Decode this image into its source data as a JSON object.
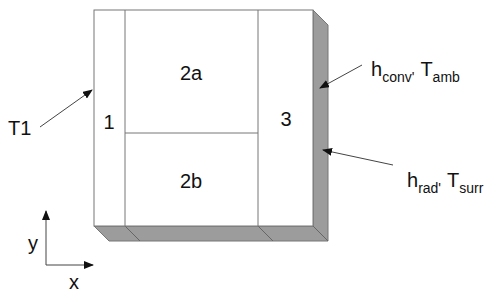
{
  "diagram": {
    "type": "layered-block-heat-transfer",
    "colors": {
      "face": "#ffffff",
      "edge": "#777777",
      "shade": "#9c9c9c",
      "arrow": "#333333",
      "text": "#111111"
    },
    "regions": [
      {
        "id": "1",
        "label": "1"
      },
      {
        "id": "2a",
        "label": "2a"
      },
      {
        "id": "2b",
        "label": "2b"
      },
      {
        "id": "3",
        "label": "3"
      }
    ],
    "boundary_conditions": {
      "left": {
        "label": "T1"
      },
      "right_top": {
        "h_main": "h",
        "h_sub": "conv",
        "sep": "'",
        "t_main": "T",
        "t_sub": "amb"
      },
      "right_bottom": {
        "h_main": "h",
        "h_sub": "rad",
        "sep": "'",
        "t_main": "T",
        "t_sub": "surr"
      }
    },
    "axes": {
      "x_label": "x",
      "y_label": "y"
    }
  }
}
